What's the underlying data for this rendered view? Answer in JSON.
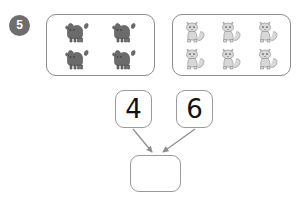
{
  "worksheet": {
    "question_number": "5",
    "groups": [
      {
        "id": "dogs",
        "icon_name": "dog-icon",
        "count": 4,
        "columns": 2,
        "rows": 2,
        "style": "filled-dark-gray",
        "color": "#6b6b6b"
      },
      {
        "id": "cats",
        "icon_name": "cat-icon",
        "count": 6,
        "columns": 3,
        "rows": 2,
        "style": "light-gray-outline",
        "color": "#b0b0b0"
      }
    ],
    "number_cards": [
      {
        "id": "left",
        "value": "4"
      },
      {
        "id": "right",
        "value": "6"
      }
    ],
    "answer_box": {
      "value": "",
      "placeholder": ""
    },
    "connectors": [
      {
        "from": "left-number-card",
        "to": "answer-box"
      },
      {
        "from": "right-number-card",
        "to": "answer-box"
      }
    ],
    "colors": {
      "badge_background": "#6e6e6e",
      "badge_text": "#ffffff",
      "box_border": "#8c8c8c",
      "card_border": "#9a9a9a",
      "arrow": "#8c8c8c",
      "page_background": "#ffffff",
      "number_text": "#111111"
    }
  }
}
